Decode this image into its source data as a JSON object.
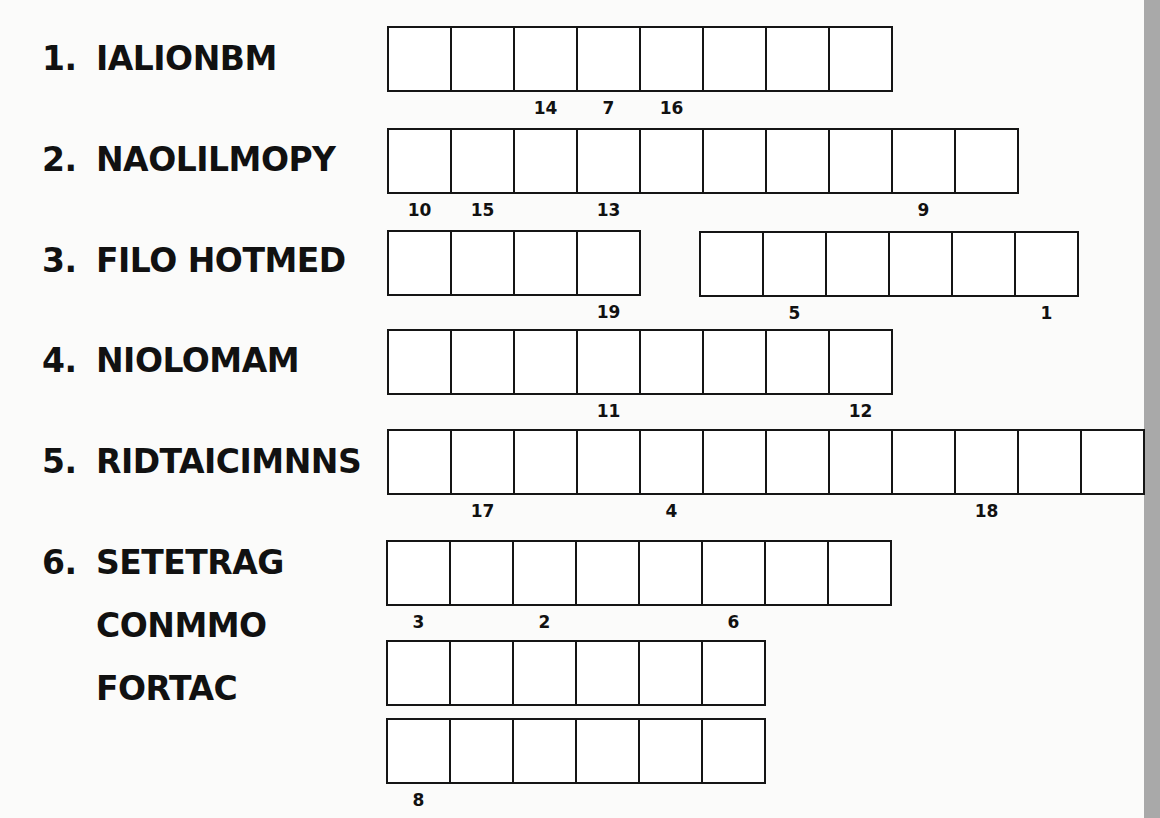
{
  "puzzle": {
    "clues": [
      {
        "number": "1.",
        "scrambled": "IALIONBM"
      },
      {
        "number": "2.",
        "scrambled": "NAOLILMOPY"
      },
      {
        "number": "3.",
        "scrambled": "FILO HOTMED"
      },
      {
        "number": "4.",
        "scrambled": "NIOLOMAM"
      },
      {
        "number": "5.",
        "scrambled": "RIDTAICIMNNS"
      },
      {
        "number": "6.",
        "scrambled": "SETETRAG",
        "continuation": [
          "CONMMO",
          "FORTAC"
        ]
      }
    ],
    "answer_grids": [
      {
        "clue": 1,
        "groups": [
          {
            "boxes": 8,
            "hints": {
              "3": "14",
              "4": "7",
              "5": "16"
            }
          }
        ]
      },
      {
        "clue": 2,
        "groups": [
          {
            "boxes": 10,
            "hints": {
              "1": "10",
              "2": "15",
              "4": "13",
              "9": "9"
            }
          }
        ]
      },
      {
        "clue": 3,
        "groups": [
          {
            "boxes": 4,
            "hints": {
              "4": "19"
            }
          },
          {
            "boxes": 6,
            "hints": {
              "2": "5",
              "6": "1"
            }
          }
        ]
      },
      {
        "clue": 4,
        "groups": [
          {
            "boxes": 8,
            "hints": {
              "4": "11",
              "8": "12"
            }
          }
        ]
      },
      {
        "clue": 5,
        "groups": [
          {
            "boxes": 12,
            "hints": {
              "2": "17",
              "5": "4",
              "10": "18"
            }
          }
        ]
      },
      {
        "clue": 6,
        "groups": [
          {
            "boxes": 8,
            "hints": {
              "1": "3",
              "3": "2",
              "6": "6"
            }
          },
          {
            "boxes": 6,
            "hints": {}
          },
          {
            "boxes": 6,
            "hints": {
              "1": "8"
            }
          }
        ]
      }
    ]
  },
  "labels": {
    "c1_num": "1.",
    "c1_word": "IALIONBM",
    "c2_num": "2.",
    "c2_word": "NAOLILMOPY",
    "c3_num": "3.",
    "c3_word": "FILO HOTMED",
    "c4_num": "4.",
    "c4_word": "NIOLOMAM",
    "c5_num": "5.",
    "c5_word": "RIDTAICIMNNS",
    "c6_num": "6.",
    "c6_word": "SETETRAG",
    "c6_line2": "CONMMO",
    "c6_line3": "FORTAC"
  },
  "hints": {
    "r1": [
      "",
      "",
      "14",
      "7",
      "16",
      "",
      "",
      ""
    ],
    "r2": [
      "10",
      "15",
      "",
      "13",
      "",
      "",
      "",
      "",
      "9",
      ""
    ],
    "r3a": [
      "",
      "",
      "",
      "19"
    ],
    "r3b": [
      "",
      "5",
      "",
      "",
      "",
      "1"
    ],
    "r4": [
      "",
      "",
      "",
      "11",
      "",
      "",
      "",
      "12"
    ],
    "r5": [
      "",
      "17",
      "",
      "",
      "4",
      "",
      "",
      "",
      "",
      "18",
      "",
      ""
    ],
    "r6a": [
      "3",
      "",
      "2",
      "",
      "",
      "6",
      "",
      ""
    ],
    "r6b": [
      "",
      "",
      "",
      "",
      "",
      ""
    ],
    "r6c": [
      "8",
      "",
      "",
      "",
      "",
      ""
    ]
  },
  "colors": {
    "background": "#fbfbfa",
    "ink": "#111111",
    "edge_strip": "#a9a9a9"
  }
}
